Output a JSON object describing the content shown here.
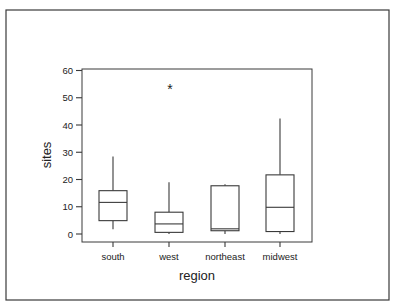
{
  "chart_data": {
    "type": "box",
    "title": "",
    "xlabel": "region",
    "ylabel": "sites",
    "ylim": [
      0,
      60
    ],
    "yticks": [
      0,
      10,
      20,
      30,
      40,
      50,
      60
    ],
    "categories": [
      "south",
      "west",
      "northeast",
      "midwest"
    ],
    "boxes": [
      {
        "category": "south",
        "whisker_low": 1.7,
        "q1": 4.9,
        "median": 11.6,
        "q3": 15.9,
        "whisker_high": 28.4,
        "outliers": []
      },
      {
        "category": "west",
        "whisker_low": 0.0,
        "q1": 0.6,
        "median": 3.7,
        "q3": 8.0,
        "whisker_high": 19.0,
        "outliers": [
          53.6
        ]
      },
      {
        "category": "northeast",
        "whisker_low": 0.0,
        "q1": 1.2,
        "median": 1.9,
        "q3": 17.7,
        "whisker_high": 18.3,
        "outliers": []
      },
      {
        "category": "midwest",
        "whisker_low": 0.0,
        "q1": 0.9,
        "median": 9.8,
        "q3": 21.7,
        "whisker_high": 42.4,
        "outliers": []
      }
    ],
    "outlier_marker": "*",
    "grid": false,
    "legend": null
  },
  "colors": {
    "line": "#3a3a3a",
    "background": "#ffffff"
  }
}
